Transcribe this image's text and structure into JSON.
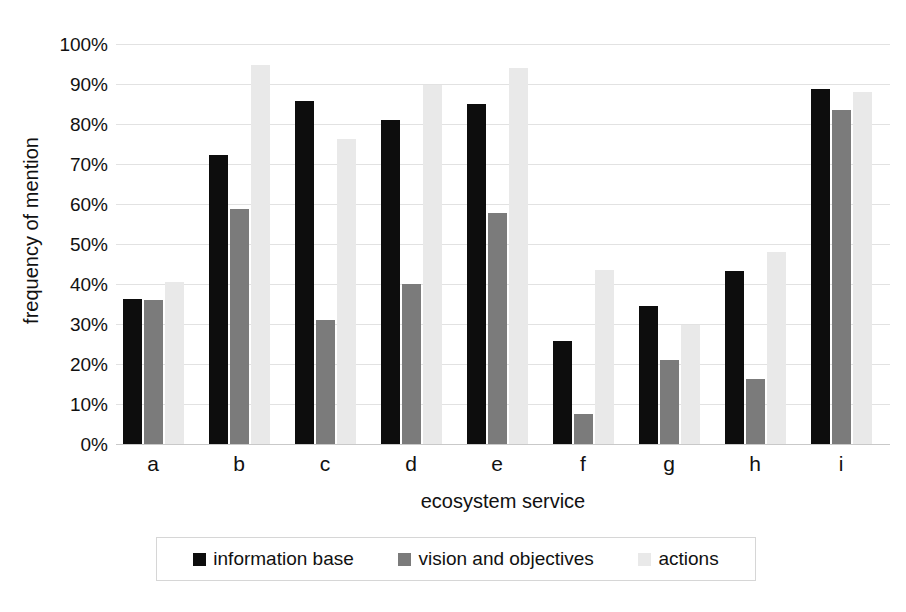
{
  "chart_data": {
    "type": "bar",
    "title": "",
    "xlabel": "ecosystem service",
    "ylabel": "frequency of mention",
    "ylim": [
      0,
      100
    ],
    "y_unit": "%",
    "grid": true,
    "legend_position": "bottom",
    "categories": [
      "a",
      "b",
      "c",
      "d",
      "e",
      "f",
      "g",
      "h",
      "i"
    ],
    "ytick_labels": [
      "0%",
      "10%",
      "20%",
      "30%",
      "40%",
      "50%",
      "60%",
      "70%",
      "80%",
      "90%",
      "100%"
    ],
    "ytick_values": [
      0,
      10,
      20,
      30,
      40,
      50,
      60,
      70,
      80,
      90,
      100
    ],
    "series": [
      {
        "name": "information base",
        "color": "#0d0d0d",
        "values": [
          36.2,
          72.3,
          85.7,
          81.0,
          85.0,
          25.7,
          34.5,
          43.3,
          88.7
        ]
      },
      {
        "name": "vision and objectives",
        "color": "#7b7b7b",
        "values": [
          36.1,
          58.8,
          31.0,
          40.0,
          57.8,
          7.5,
          21.0,
          16.2,
          83.6
        ]
      },
      {
        "name": "actions",
        "color": "#e9e9e9",
        "values": [
          40.6,
          94.8,
          76.3,
          89.7,
          94.0,
          43.6,
          29.7,
          48.0,
          88.1
        ]
      }
    ]
  },
  "legend": {
    "entries": [
      {
        "label": "information base",
        "color": "#0d0d0d"
      },
      {
        "label": "vision and objectives",
        "color": "#7b7b7b"
      },
      {
        "label": "actions",
        "color": "#e9e9e9"
      }
    ]
  }
}
